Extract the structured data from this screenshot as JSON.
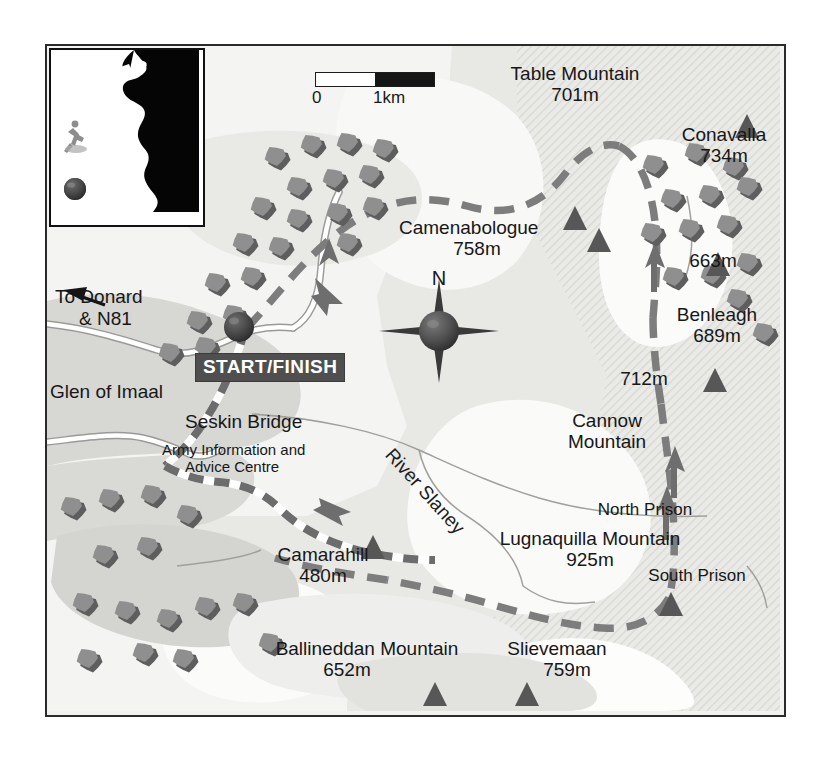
{
  "map": {
    "title": "Glen of Imaal / Lugnaquilla walking route map",
    "scale": {
      "zero_label": "0",
      "one_label": "1km"
    },
    "compass": {
      "north_label": "N"
    },
    "route_marker_label": "START/FINISH",
    "colors": {
      "paper": "#f2f2f0",
      "border": "#2b2b2b",
      "band_light": "#f6f6f4",
      "band_mid": "#e4e4e1",
      "band_dark": "#d2d2cf",
      "band_darkest": "#c2c2bf",
      "hatch": "#d8d8d5",
      "route_dash": "#7d7d7d",
      "road": "#ffffff",
      "river": "#9a9a9a",
      "tree_light": "#8f8f8f",
      "tree_dark": "#5e5e5e",
      "peak": "#555555",
      "text": "#171717",
      "chip_bg": "#4f4f4f",
      "chip_text": "#ffffff"
    },
    "labels": [
      {
        "id": "table-mountain",
        "name": "Table Mountain",
        "elevation": "701m"
      },
      {
        "id": "conavalla",
        "name": "Conavalla",
        "elevation": "734m"
      },
      {
        "id": "camenabologue",
        "name": "Camenabologue",
        "elevation": "758m"
      },
      {
        "id": "peak-663",
        "name": "",
        "elevation": "663m"
      },
      {
        "id": "benleagh",
        "name": "Benleagh",
        "elevation": "689m"
      },
      {
        "id": "peak-712",
        "name": "",
        "elevation": "712m"
      },
      {
        "id": "cannow-mountain",
        "name": "Cannow Mountain",
        "elevation": ""
      },
      {
        "id": "north-prison",
        "name": "North Prison",
        "elevation": ""
      },
      {
        "id": "south-prison",
        "name": "South Prison",
        "elevation": ""
      },
      {
        "id": "lugnaquilla",
        "name": "Lugnaquilla Mountain",
        "elevation": "925m"
      },
      {
        "id": "camarahill",
        "name": "Camarahill",
        "elevation": "480m"
      },
      {
        "id": "ballineddan",
        "name": "Ballineddan Mountain",
        "elevation": "652m"
      },
      {
        "id": "slievemaan",
        "name": "Slievemaan",
        "elevation": "759m"
      },
      {
        "id": "glen-of-imaal",
        "name": "Glen of Imaal",
        "elevation": ""
      },
      {
        "id": "seskin-bridge",
        "name": "Seskin Bridge",
        "elevation": ""
      },
      {
        "id": "army-centre",
        "name": "Army Information and Advice Centre",
        "elevation": ""
      },
      {
        "id": "to-donard",
        "name": "To Donard & N81",
        "elevation": ""
      },
      {
        "id": "river-slaney",
        "name": "River Slaney",
        "elevation": ""
      }
    ],
    "text": {
      "table_mountain_name": "Table Mountain",
      "table_mountain_elev": "701m",
      "conavalla_name": "Conavalla",
      "conavalla_elev": "734m",
      "camenabologue_name": "Camenabologue",
      "camenabologue_elev": "758m",
      "peak663_elev": "663m",
      "benleagh_name": "Benleagh",
      "benleagh_elev": "689m",
      "peak712_elev": "712m",
      "cannow_line1": "Cannow",
      "cannow_line2": "Mountain",
      "north_prison": "North Prison",
      "south_prison": "South Prison",
      "lugnaquilla_name": "Lugnaquilla Mountain",
      "lugnaquilla_elev": "925m",
      "camarahill_name": "Camarahill",
      "camarahill_elev": "480m",
      "ballineddan_name": "Ballineddan Mountain",
      "ballineddan_elev": "652m",
      "slievemaan_name": "Slievemaan",
      "slievemaan_elev": "759m",
      "glen_of_imaal": "Glen of Imaal",
      "seskin_bridge": "Seskin Bridge",
      "army_line1": "Army Information and",
      "army_line2": "Advice Centre",
      "to_donard_line1": "To Donard",
      "to_donard_line2": "& N81",
      "river_slaney": "River Slaney",
      "start_finish": "START/FINISH"
    }
  }
}
